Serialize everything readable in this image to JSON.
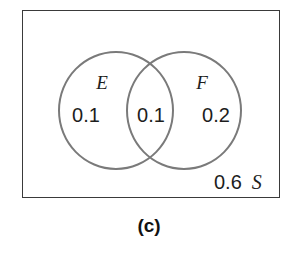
{
  "figure": {
    "caption": "(c)",
    "universe": {
      "name": "S",
      "outside_probability": "0.6"
    },
    "sets": [
      {
        "name": "E",
        "only_probability": "0.1"
      },
      {
        "name": "F",
        "only_probability": "0.2"
      }
    ],
    "intersection": {
      "probability": "0.1"
    },
    "colors": {
      "rectangle_stroke": "#3a3a3a",
      "circle_stroke": "#7a7a7a",
      "text": "#1d1d1d",
      "background": "#ffffff"
    }
  },
  "chart_data": {
    "type": "diagram",
    "subtype": "venn",
    "title": "(c)",
    "universe_label": "S",
    "sets": [
      "E",
      "F"
    ],
    "regions": [
      {
        "label": "E only",
        "value": 0.1,
        "text": "0.1"
      },
      {
        "label": "E and F",
        "value": 0.1,
        "text": "0.1"
      },
      {
        "label": "F only",
        "value": 0.2,
        "text": "0.2"
      },
      {
        "label": "outside",
        "value": 0.6,
        "text": "0.6"
      }
    ],
    "total": 1.0,
    "grid": false,
    "legend": "none"
  }
}
